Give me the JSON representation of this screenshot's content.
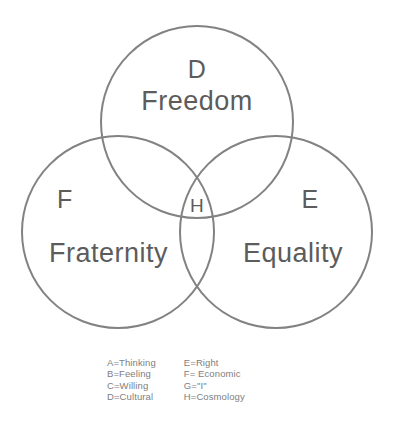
{
  "diagram": {
    "type": "venn-3-set",
    "title_present": false,
    "background_color": "#ffffff",
    "stroke_color": "#828282",
    "label_color": "#5c5c5c",
    "legend_color": "#7e7e7e",
    "sets": [
      {
        "id": "top",
        "letter": "D",
        "name": "Freedom",
        "center_x": 197,
        "center_y": 122,
        "radius": 96
      },
      {
        "id": "left",
        "letter": "F",
        "name": "Fraternity",
        "center_x": 118,
        "center_y": 232,
        "radius": 96
      },
      {
        "id": "right",
        "letter": "E",
        "name": "Equality",
        "center_x": 276,
        "center_y": 232,
        "radius": 96
      }
    ],
    "center_intersection": {
      "letter": "H",
      "x": 197,
      "y": 206
    }
  },
  "legend": {
    "left_column": [
      "A=Thinking",
      "B=Feeling",
      "C=Willing",
      "D=Cultural"
    ],
    "right_column": [
      "E=Right",
      "F= Economic",
      "G=\"I\"",
      "H=Cosmology"
    ]
  }
}
